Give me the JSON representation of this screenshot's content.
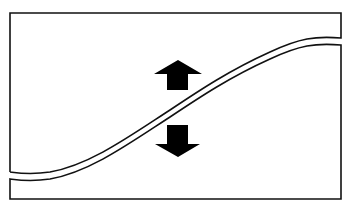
{
  "diagram": {
    "colors": {
      "background": "#ffffff",
      "stroke": "#111111",
      "arrow_fill": "#000000"
    },
    "elements": [
      {
        "id": "frame",
        "type": "open-rectangle",
        "description": "box split by a wavy double-line boundary"
      },
      {
        "id": "boundary",
        "type": "double-s-curve",
        "description": "two parallel S-shaped lines rising from lower-left to upper-right"
      },
      {
        "id": "arrow-up",
        "type": "arrow",
        "direction": "up",
        "description": "solid arrow above the curve pointing up"
      },
      {
        "id": "arrow-down",
        "type": "arrow",
        "direction": "down",
        "description": "solid arrow below the curve pointing down"
      }
    ]
  }
}
